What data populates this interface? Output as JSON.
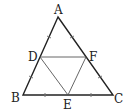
{
  "diagram": {
    "type": "geometry",
    "colors": {
      "outer": "#222222",
      "inner": "#555555",
      "tick": "#777777"
    },
    "points": {
      "A": {
        "label": "A",
        "x": 58,
        "y": 17
      },
      "B": {
        "label": "B",
        "x": 23,
        "y": 95
      },
      "C": {
        "label": "C",
        "x": 113,
        "y": 95
      },
      "D": {
        "label": "D",
        "x": 40,
        "y": 57
      },
      "E": {
        "label": "E",
        "x": 68,
        "y": 95
      },
      "F": {
        "label": "F",
        "x": 86,
        "y": 57
      }
    },
    "outer_triangle": [
      "A",
      "B",
      "C"
    ],
    "inner_triangle": [
      "D",
      "E",
      "F"
    ],
    "segments": [
      [
        "A",
        "B"
      ],
      [
        "B",
        "C"
      ],
      [
        "C",
        "A"
      ],
      [
        "D",
        "F"
      ],
      [
        "D",
        "E"
      ],
      [
        "E",
        "F"
      ]
    ],
    "tick_marks": "equal-length marks on AD, DB, AF, FC, BE, EC"
  }
}
